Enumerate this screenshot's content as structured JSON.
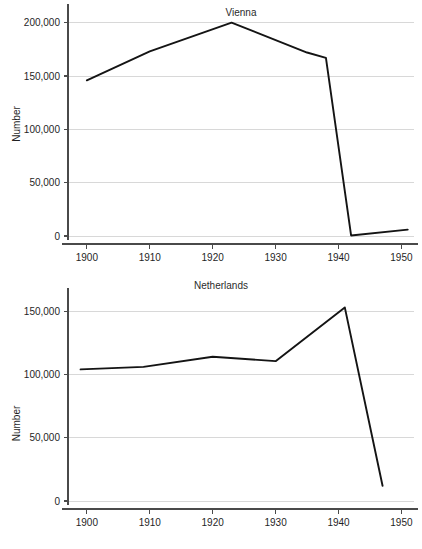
{
  "chart_data": [
    {
      "type": "line",
      "title": "Vienna",
      "xlabel": "",
      "ylabel": "Number",
      "xlim": [
        1897,
        1952
      ],
      "ylim": [
        0,
        210000
      ],
      "xticks": [
        1900,
        1910,
        1920,
        1930,
        1940,
        1950
      ],
      "xtick_labels": [
        "1900",
        "1910",
        "1920",
        "1930",
        "1940",
        "1950"
      ],
      "yticks": [
        0,
        50000,
        100000,
        150000,
        200000
      ],
      "ytick_labels": [
        "0",
        "50,000",
        "100,000",
        "150,000",
        "200,000"
      ],
      "grid": true,
      "legend": "none",
      "series": [
        {
          "name": "Vienna",
          "x": [
            1900,
            1910,
            1923,
            1935,
            1938,
            1942,
            1951
          ],
          "values": [
            146000,
            173000,
            200000,
            172000,
            167000,
            500,
            6000
          ]
        }
      ]
    },
    {
      "type": "line",
      "title": "Netherlands",
      "xlabel": "",
      "ylabel": "Number",
      "xlim": [
        1897,
        1952
      ],
      "ylim": [
        0,
        162000
      ],
      "xticks": [
        1900,
        1910,
        1920,
        1930,
        1940,
        1950
      ],
      "xtick_labels": [
        "1900",
        "1910",
        "1920",
        "1930",
        "1940",
        "1950"
      ],
      "yticks": [
        0,
        50000,
        100000,
        150000
      ],
      "ytick_labels": [
        "0",
        "50,000",
        "100,000",
        "150,000"
      ],
      "grid": true,
      "legend": "none",
      "series": [
        {
          "name": "Netherlands",
          "x": [
            1899,
            1909,
            1920,
            1930,
            1941,
            1947
          ],
          "values": [
            104000,
            106000,
            114000,
            110500,
            153000,
            12000
          ]
        }
      ]
    }
  ]
}
